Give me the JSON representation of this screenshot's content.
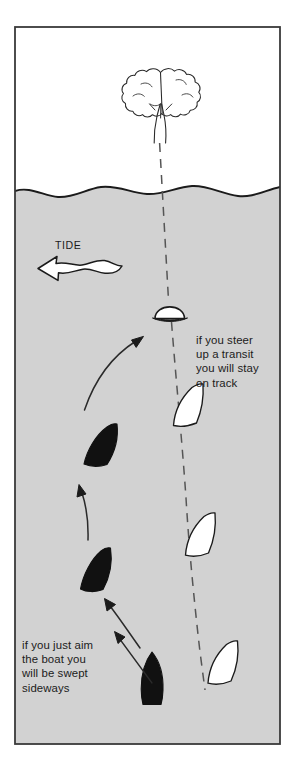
{
  "figure": {
    "frame": {
      "x": 14,
      "y": 26,
      "width": 267,
      "height": 719,
      "border_color": "#3a3a3a",
      "sky_color": "#ffffff",
      "water_color": "#d2d2d2"
    },
    "waterline_label": "shoreline",
    "tide": {
      "label": "TIDE",
      "direction": "left",
      "arrow_fill": "#ffffff",
      "arrow_stroke": "#1b1b1b"
    },
    "landmarks": [
      {
        "name": "tree",
        "kind": "transit-mark-shore",
        "fill": "#ffffff",
        "stroke": "#1b1b1b"
      },
      {
        "name": "buoy",
        "kind": "transit-mark-water",
        "fill": "#ffffff",
        "stroke": "#1b1b1b"
      }
    ],
    "transit_line": {
      "name": "transit-dashed-line",
      "style": "dashed",
      "color": "#555555"
    },
    "annotations": [
      {
        "id": "on-track",
        "lines": [
          "if you steer",
          "up a transit",
          "you will stay",
          "on track"
        ],
        "text": "if you steer\nup a transit\nyou will stay\non track"
      },
      {
        "id": "swept-sideways",
        "lines": [
          "if you just aim",
          "the boat you",
          "will be swept",
          "sideways"
        ],
        "text": "if you just aim\nthe boat you\nwill be swept\nsideways"
      }
    ],
    "boats": {
      "on_transit": {
        "label": "white-boats-on-transit",
        "count": 3,
        "fill": "#ffffff",
        "stroke": "#1b1b1b"
      },
      "swept": {
        "label": "black-boats-swept",
        "count": 3,
        "fill": "#111111",
        "stroke": "#111111"
      },
      "start_pair": {
        "label": "starting-position-boats",
        "count": 2
      }
    },
    "track_arrows": {
      "label": "swept-track-arrows",
      "count": 3,
      "color": "#2a2a2a"
    },
    "colors": {
      "ink": "#1b1b1b",
      "water": "#d2d2d2",
      "sky": "#ffffff",
      "dash": "#555555",
      "hull_dark": "#111111"
    }
  }
}
